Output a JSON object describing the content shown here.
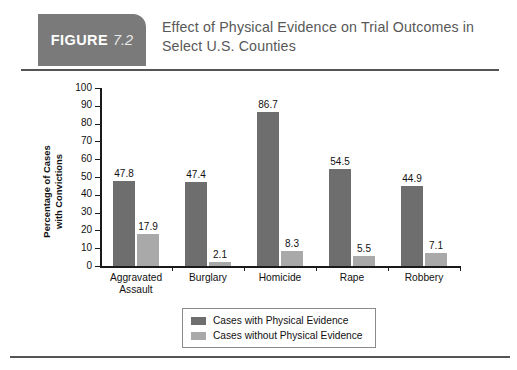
{
  "header": {
    "badge_word": "FIGURE",
    "badge_number": "7.2",
    "title": "Effect of Physical Evidence on Trial Outcomes in Select U.S. Counties"
  },
  "chart_data": {
    "type": "bar",
    "title": "Effect of Physical Evidence on Trial Outcomes in Select U.S. Counties",
    "xlabel": "",
    "ylabel": "Percentage of Cases\nwith Convictions",
    "ylim": [
      0,
      100
    ],
    "ytick_step": 10,
    "yticks": [
      "100",
      "90",
      "80",
      "70",
      "60",
      "50",
      "40",
      "30",
      "20",
      "10",
      "0"
    ],
    "grid": false,
    "legend_position": "bottom",
    "categories": [
      "Aggravated\nAssault",
      "Burglary",
      "Homicide",
      "Rape",
      "Robbery"
    ],
    "series": [
      {
        "name": "Cases with Physical Evidence",
        "color": "#6e6e6e",
        "values": [
          47.8,
          47.4,
          86.7,
          54.5,
          44.9
        ],
        "labels": [
          "47.8",
          "47.4",
          "86.7",
          "54.5",
          "44.9"
        ]
      },
      {
        "name": "Cases without Physical Evidence",
        "color": "#a9a9a9",
        "values": [
          17.9,
          2.1,
          8.3,
          5.5,
          7.1
        ],
        "labels": [
          "17.9",
          "2.1",
          "8.3",
          "5.5",
          "7.1"
        ]
      }
    ]
  }
}
